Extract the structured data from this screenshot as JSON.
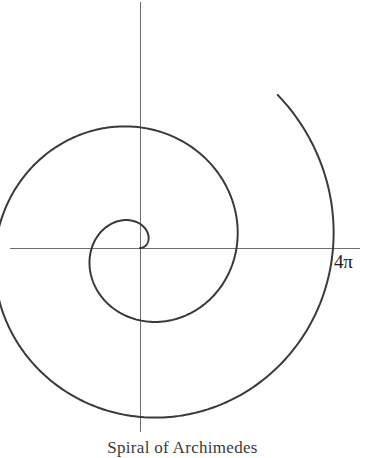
{
  "figure": {
    "caption": "Spiral of Archimedes",
    "background_color": "#ffffff",
    "curve_color": "#3a3a3a",
    "axis_color": "#6e6e6e",
    "label_color": "#1e1e1e"
  },
  "axes": {
    "x_axis_name": "horizontal-axis",
    "y_axis_name": "vertical-axis",
    "origin_x": 140,
    "origin_y": 248,
    "x_axis_start": 10,
    "x_axis_end": 360,
    "y_axis_start": 2,
    "y_axis_end": 432
  },
  "labels": {
    "radial_tick": "4π"
  },
  "chart_data": {
    "type": "line",
    "title": "Spiral of Archimedes",
    "subtitle": "",
    "xlabel": "",
    "ylabel": "",
    "curve_equation": "r = aθ",
    "coordinate_system": "polar",
    "grid": false,
    "legend": null,
    "annotations": [
      {
        "text": "4π",
        "theta_rad": 12.566370614,
        "r": 193,
        "x_px": 333,
        "y_px": 248,
        "meaning": "radius at theta = 4pi, where the spiral last crosses the positive x-axis"
      }
    ],
    "theta_start": 0,
    "theta_end": 13.404,
    "theta_end_label": "just past 4π",
    "a_pixels_per_radian": 15.36,
    "turns": 2.13,
    "direction": "counterclockwise",
    "sample_count": 720,
    "axis_ranges": {
      "x_px": [
        10,
        360
      ],
      "y_px": [
        2,
        432
      ]
    },
    "key_points": [
      {
        "name": "origin",
        "theta_rad": 0,
        "r_px": 0,
        "x_px": 140,
        "y_px": 248
      },
      {
        "name": "inner-loop-top",
        "theta_rad": 1.5708,
        "r_px": 24,
        "x_px": 140,
        "y_px": 224
      },
      {
        "name": "inner-loop-left",
        "theta_rad": 3.1416,
        "r_px": 48,
        "x_px": 92,
        "y_px": 248
      },
      {
        "name": "inner-loop-bottom-return",
        "theta_rad": 4.7124,
        "r_px": 72,
        "x_px": 140,
        "y_px": 320
      },
      {
        "name": "first-turn-cross-2pi",
        "theta_rad": 6.2832,
        "r_px": 97,
        "x_px": 237,
        "y_px": 248
      },
      {
        "name": "outer-top",
        "theta_rad": 7.854,
        "r_px": 121,
        "x_px": 140,
        "y_px": 127
      },
      {
        "name": "outer-left",
        "theta_rad": 9.4248,
        "r_px": 145,
        "x_px": -5,
        "y_px": 248
      },
      {
        "name": "outer-bottom",
        "theta_rad": 10.9956,
        "r_px": 169,
        "x_px": 140,
        "y_px": 417
      },
      {
        "name": "cross-4pi",
        "theta_rad": 12.5664,
        "r_px": 193,
        "x_px": 333,
        "y_px": 248
      },
      {
        "name": "curve-end",
        "theta_rad": 13.404,
        "r_px": 206,
        "x_px": 117,
        "y_px": 13
      }
    ],
    "series": [
      {
        "name": "archimedean-spiral",
        "r_of_theta": [
          {
            "theta": 0.0,
            "r": 0
          },
          {
            "theta": 0.7854,
            "r": 12
          },
          {
            "theta": 1.5708,
            "r": 24
          },
          {
            "theta": 2.3562,
            "r": 36
          },
          {
            "theta": 3.1416,
            "r": 48
          },
          {
            "theta": 3.927,
            "r": 60
          },
          {
            "theta": 4.7124,
            "r": 72
          },
          {
            "theta": 5.4978,
            "r": 84
          },
          {
            "theta": 6.2832,
            "r": 97
          },
          {
            "theta": 7.0686,
            "r": 109
          },
          {
            "theta": 7.854,
            "r": 121
          },
          {
            "theta": 8.6394,
            "r": 133
          },
          {
            "theta": 9.4248,
            "r": 145
          },
          {
            "theta": 10.2102,
            "r": 157
          },
          {
            "theta": 10.9956,
            "r": 169
          },
          {
            "theta": 11.781,
            "r": 181
          },
          {
            "theta": 12.5664,
            "r": 193
          },
          {
            "theta": 13.404,
            "r": 206
          }
        ]
      }
    ]
  }
}
